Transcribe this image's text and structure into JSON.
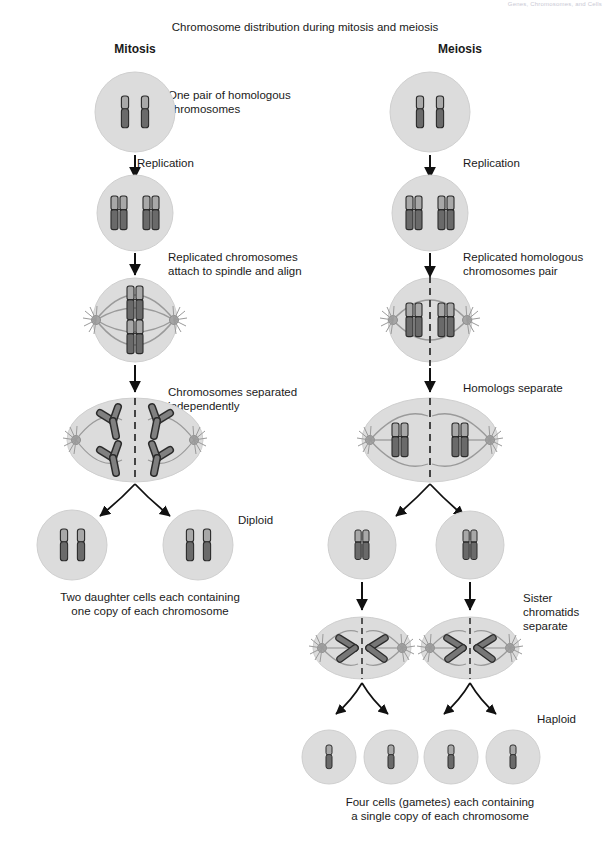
{
  "page_header": "Genes, Chromosomes, and Cells",
  "figure": {
    "title": "Chromosome distribution during mitosis and meiosis",
    "columns": [
      {
        "id": "mitosis",
        "label": "Mitosis"
      },
      {
        "id": "meiosis",
        "label": "Meiosis"
      }
    ]
  },
  "colors": {
    "cell_fill": "#dcdcdc",
    "cell_stroke": "#bdbdbd",
    "chromosome_dark": "#545454",
    "chromosome_light": "#a8a8a8",
    "chromosome_outline": "#2b2b2b",
    "spindle": "#9a9a9a",
    "centrosome": "#9e9e9e",
    "arrow": "#111111",
    "text": "#1a1a1a",
    "header_text": "#c9c9d4"
  },
  "mitosis": {
    "steps": [
      {
        "id": "m-parent",
        "caption": "One pair of homologous\nchromosomes"
      },
      {
        "id": "m-replication",
        "caption": "Replication"
      },
      {
        "id": "m-replicated",
        "caption": ""
      },
      {
        "id": "m-metaphase",
        "caption": "Replicated chromosomes\nattach to spindle and align"
      },
      {
        "id": "m-anaphase",
        "caption": "Chromosomes separated\nindependently"
      },
      {
        "id": "m-daughters",
        "caption": "Diploid"
      }
    ],
    "summary": "Two daughter cells each containing\none copy of each chromosome"
  },
  "meiosis": {
    "steps": [
      {
        "id": "me-parent",
        "caption": ""
      },
      {
        "id": "me-replication",
        "caption": "Replication"
      },
      {
        "id": "me-replicated",
        "caption": ""
      },
      {
        "id": "me-metaphase1",
        "caption": "Replicated homologous\nchromosomes pair"
      },
      {
        "id": "me-anaphase1",
        "caption": "Homologs separate"
      },
      {
        "id": "me-secondary",
        "caption": ""
      },
      {
        "id": "me-anaphase2",
        "caption": "Sister\nchromatids\nseparate"
      },
      {
        "id": "me-gametes",
        "caption": "Haploid"
      }
    ],
    "summary": "Four cells (gametes) each containing\na single copy of each chromosome"
  }
}
